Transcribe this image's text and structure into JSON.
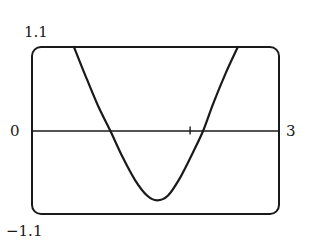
{
  "chart_data": {
    "type": "line",
    "title": "",
    "xlabel": "",
    "ylabel": "",
    "xlim": [
      0,
      3
    ],
    "ylim": [
      -1.1,
      1.1
    ],
    "grid": false,
    "legend": null,
    "tick_labels": {
      "y_top": "1.1",
      "y_zero": "0",
      "y_bottom": "−1.1",
      "x_right": "3"
    },
    "x_axis_ticks": [
      1.92
    ],
    "series": [
      {
        "name": "curve",
        "x": [
          0.51,
          0.65,
          0.8,
          0.95,
          1.1,
          1.25,
          1.4,
          1.52,
          1.65,
          1.8,
          1.95,
          2.08,
          2.2,
          2.35,
          2.5
        ],
        "y": [
          1.1,
          0.72,
          0.33,
          0.0,
          -0.35,
          -0.65,
          -0.86,
          -0.92,
          -0.86,
          -0.62,
          -0.3,
          0.0,
          0.35,
          0.75,
          1.1
        ]
      }
    ],
    "annotations": []
  },
  "frame": {
    "stroke": "#1a1a1a",
    "corner_radius": 8
  },
  "colors": {
    "line": "#1a1a1a",
    "background": "#ffffff"
  }
}
